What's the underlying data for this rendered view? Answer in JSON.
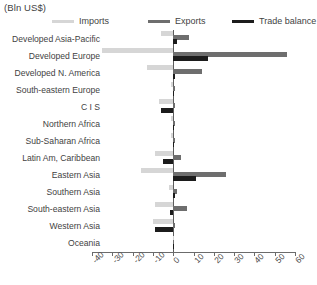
{
  "axis_unit_label": "(Bln US$)",
  "legend": {
    "items": [
      {
        "label": "Imports",
        "color": "#d6d6d6",
        "left": 0
      },
      {
        "label": "Exports",
        "color": "#6e6e6e",
        "left": 96
      },
      {
        "label": "Trade balance",
        "color": "#1c1c1c",
        "left": 180
      }
    ]
  },
  "chart_data": {
    "type": "bar",
    "orientation": "horizontal",
    "title": "",
    "subtitle": "",
    "xlabel": "(Bln US$)",
    "ylabel": "",
    "xlim": [
      -40,
      60
    ],
    "xticks": [
      -40,
      -30,
      -20,
      -10,
      0,
      10,
      20,
      30,
      40,
      50,
      60
    ],
    "xtick_labels": [
      "-40",
      "-30",
      "-20",
      "-10",
      "0",
      "10",
      "20",
      "30",
      "40",
      "50",
      "60"
    ],
    "grid": false,
    "legend_position": "top",
    "categories": [
      "Developed Asia-Pacific",
      "Developed Europe",
      "Developed N. America",
      "South-eastern Europe",
      "C I S",
      "Northern Africa",
      "Sub-Saharan Africa",
      "Latin Am, Caribbean",
      "Eastern Asia",
      "Southern Asia",
      "South-eastern Asia",
      "Western Asia",
      "Oceania"
    ],
    "series": [
      {
        "name": "Imports",
        "color": "#d6d6d6",
        "values": [
          -6.0,
          -35.0,
          -13.0,
          -1.0,
          -7.0,
          -1.0,
          -1.0,
          -9.0,
          -16.0,
          -2.0,
          -9.0,
          -10.0,
          -0.3
        ]
      },
      {
        "name": "Exports",
        "color": "#6e6e6e",
        "values": [
          8.0,
          56.0,
          14.0,
          1.0,
          1.0,
          1.0,
          1.0,
          4.0,
          26.0,
          2.0,
          7.0,
          1.0,
          0.3
        ]
      },
      {
        "name": "Trade balance",
        "color": "#1c1c1c",
        "values": [
          2.0,
          17.0,
          1.0,
          0.5,
          -6.0,
          0.5,
          0.5,
          -5.0,
          11.0,
          1.0,
          -1.5,
          -9.0,
          0.2
        ]
      }
    ]
  }
}
